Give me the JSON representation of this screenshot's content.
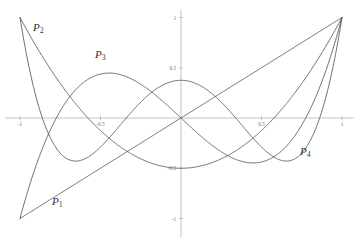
{
  "figure": {
    "title": "",
    "background_color": "#ffffff",
    "curve_color": "#55555a",
    "axis_color": "#b4b4b4",
    "label_color": "#2e2e32"
  },
  "axes": {
    "x_ticks": [
      {
        "value": -1,
        "label": "-1"
      },
      {
        "value": -0.5,
        "label": "-0.5"
      },
      {
        "value": 0.5,
        "label": "0.5"
      },
      {
        "value": 1,
        "label": "1"
      }
    ],
    "y_ticks": [
      {
        "value": 1,
        "label": "1"
      },
      {
        "value": 0.5,
        "label": "0.5"
      },
      {
        "value": -0.5,
        "label": "-0.5"
      },
      {
        "value": -1,
        "label": "-1"
      }
    ],
    "xlim": [
      -1.08,
      1.01
    ],
    "ylim": [
      -1.18,
      1.06
    ]
  },
  "labels": {
    "p1": {
      "text": "P",
      "sub": "1"
    },
    "p2": {
      "text": "P",
      "sub": "2"
    },
    "p3": {
      "text": "P",
      "sub": "3"
    },
    "p4": {
      "text": "P",
      "sub": "4"
    }
  },
  "chart_data": {
    "type": "line",
    "title": "",
    "xlabel": "",
    "ylabel": "",
    "xlim": [
      -1.08,
      1.01
    ],
    "ylim": [
      -1.18,
      1.06
    ],
    "grid": false,
    "legend": "inline-annotations",
    "annotations": [
      {
        "text": "P1",
        "x": -0.72,
        "y": -0.82
      },
      {
        "text": "P2",
        "x": -0.86,
        "y": 0.84
      },
      {
        "text": "P3",
        "x": -0.46,
        "y": 0.56
      },
      {
        "text": "P4",
        "x": 0.74,
        "y": -0.4
      }
    ],
    "x": [
      -1,
      -0.9,
      -0.8,
      -0.7,
      -0.6,
      -0.5,
      -0.4,
      -0.3,
      -0.2,
      -0.1,
      0,
      0.1,
      0.2,
      0.3,
      0.4,
      0.5,
      0.6,
      0.7,
      0.8,
      0.9,
      1
    ],
    "series": [
      {
        "name": "P1",
        "formula": "x",
        "values": [
          -1,
          -0.9,
          -0.8,
          -0.7,
          -0.6,
          -0.5,
          -0.4,
          -0.3,
          -0.2,
          -0.1,
          0,
          0.1,
          0.2,
          0.3,
          0.4,
          0.5,
          0.6,
          0.7,
          0.8,
          0.9,
          1
        ]
      },
      {
        "name": "P2",
        "formula": "(3x^2 - 1)/2",
        "values": [
          1,
          0.715,
          0.46,
          0.235,
          0.04,
          -0.125,
          -0.26,
          -0.365,
          -0.44,
          -0.485,
          -0.5,
          -0.485,
          -0.44,
          -0.365,
          -0.26,
          -0.125,
          0.04,
          0.235,
          0.46,
          0.715,
          1
        ]
      },
      {
        "name": "P3",
        "formula": "(5x^3 - 3x)/2",
        "values": [
          -1,
          -0.4725,
          -0.08,
          0.1925,
          0.36,
          0.4375,
          0.44,
          0.3825,
          0.28,
          0.1475,
          0,
          -0.1475,
          -0.28,
          -0.3825,
          -0.44,
          -0.4375,
          -0.36,
          -0.1925,
          0.08,
          0.4725,
          1
        ]
      },
      {
        "name": "P4",
        "formula": "(35x^4 - 30x^2 + 3)/8",
        "values": [
          1,
          0.2079,
          -0.233,
          -0.4284,
          -0.4424,
          -0.2891,
          -0.113,
          0.0729,
          0.232,
          0.3379,
          0.375,
          0.3379,
          0.232,
          0.0729,
          -0.113,
          -0.2891,
          -0.4424,
          -0.4284,
          -0.233,
          0.2079,
          1
        ]
      }
    ]
  }
}
